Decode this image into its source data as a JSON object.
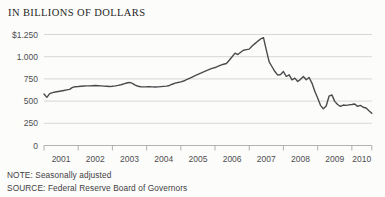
{
  "title": "IN BILLIONS OF DOLLARS",
  "note": "NOTE: Seasonally adjusted",
  "source": "SOURCE: Federal Reserve Board of Governors",
  "colors": {
    "background": "#fcfcfa",
    "line": "#4a4b4d",
    "grid": "#cdcdcb",
    "axis": "#a9a9a6",
    "axis_text": "#4d4e50",
    "title_text": "#1f1f1f"
  },
  "chart_data": {
    "type": "line",
    "title": "IN BILLIONS OF DOLLARS",
    "unit": "billions of U.S. dollars",
    "note": "Seasonally adjusted",
    "source": "Federal Reserve Board of Governors",
    "x_start": "2001-01",
    "x_end": "2010-08",
    "x_frequency": "monthly",
    "ylim": [
      0,
      1250
    ],
    "grid": "horizontal",
    "legend": "none",
    "yticks": [
      {
        "value": 0,
        "label": "0"
      },
      {
        "value": 250,
        "label": "250"
      },
      {
        "value": 500,
        "label": "500"
      },
      {
        "value": 750,
        "label": "750"
      },
      {
        "value": 1000,
        "label": "1.000"
      },
      {
        "value": 1250,
        "label": "$1.250"
      }
    ],
    "xtick_year_labels": [
      "2001",
      "2002",
      "2003",
      "2004",
      "2005",
      "2006",
      "2007",
      "2008",
      "2009",
      "2010"
    ],
    "series": [
      {
        "name": "Outstanding amount",
        "monthly_values": [
          580,
          542,
          585,
          595,
          602,
          608,
          614,
          620,
          626,
          632,
          655,
          662,
          664,
          667,
          670,
          672,
          671,
          673,
          675,
          673,
          671,
          669,
          667,
          665,
          667,
          671,
          677,
          684,
          694,
          704,
          710,
          699,
          679,
          667,
          662,
          660,
          661,
          663,
          660,
          658,
          660,
          663,
          666,
          669,
          676,
          690,
          703,
          709,
          716,
          726,
          741,
          756,
          771,
          786,
          801,
          815,
          830,
          844,
          857,
          868,
          878,
          892,
          906,
          915,
          923,
          960,
          1000,
          1040,
          1024,
          1050,
          1073,
          1080,
          1085,
          1120,
          1147,
          1175,
          1200,
          1215,
          1073,
          942,
          887,
          833,
          793,
          800,
          833,
          777,
          796,
          740,
          759,
          721,
          745,
          777,
          740,
          766,
          703,
          610,
          535,
          452,
          413,
          445,
          555,
          570,
          497,
          462,
          441,
          456,
          452,
          458,
          461,
          467,
          441,
          452,
          431,
          422,
          392,
          364
        ]
      }
    ]
  }
}
